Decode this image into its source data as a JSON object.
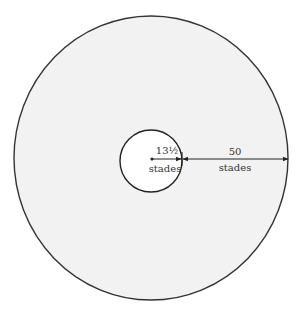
{
  "diagram": {
    "outer_circle": {
      "cx": 151,
      "cy": 158,
      "rx": 137,
      "ry": 142,
      "fill": "#f2f2f2",
      "stroke": "#333333"
    },
    "inner_circle": {
      "cx": 151,
      "cy": 161,
      "r": 31,
      "fill": "#ffffff",
      "stroke": "#222222"
    },
    "inner_label": {
      "value": "13½",
      "unit": "stades"
    },
    "outer_label": {
      "value": "50",
      "unit": "stades"
    }
  }
}
